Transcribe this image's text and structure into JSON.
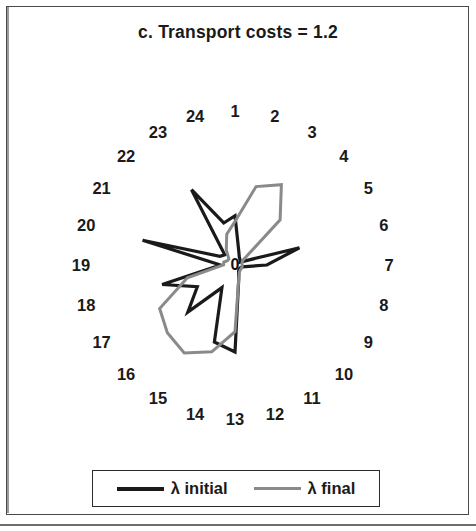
{
  "figure": {
    "title": "c. Transport costs = 1.2",
    "center_label": "0"
  },
  "legend": {
    "entries": [
      {
        "label": "λ initial",
        "color": "#1a1a1a",
        "swatch": "initial"
      },
      {
        "label": "λ final",
        "color": "#8a8a8a",
        "swatch": "final"
      }
    ]
  },
  "chart_data": {
    "type": "line",
    "subtype": "radar",
    "title": "c. Transport costs = 1.2",
    "xlabel": "",
    "ylabel": "",
    "grid": false,
    "legend_position": "bottom",
    "center_label": "0",
    "categories": [
      "1",
      "2",
      "3",
      "4",
      "5",
      "6",
      "7",
      "8",
      "9",
      "10",
      "11",
      "12",
      "13",
      "14",
      "15",
      "16",
      "17",
      "18",
      "19",
      "20",
      "21",
      "22",
      "23",
      "24"
    ],
    "angle_start_deg": 90,
    "angle_direction": "clockwise",
    "rmax": 1.0,
    "rlim": [
      0,
      1.0
    ],
    "series": [
      {
        "name": "λ initial",
        "color": "#1a1a1a",
        "values": [
          0.34,
          0.1,
          0.06,
          0.05,
          0.04,
          0.46,
          0.22,
          0.05,
          0.04,
          0.04,
          0.05,
          0.1,
          0.6,
          0.55,
          0.18,
          0.46,
          0.3,
          0.52,
          0.1,
          0.66,
          0.12,
          0.1,
          0.6,
          0.3
        ]
      },
      {
        "name": "λ final",
        "color": "#8a8a8a",
        "values": [
          0.3,
          0.56,
          0.64,
          0.44,
          0.06,
          0.05,
          0.05,
          0.05,
          0.05,
          0.05,
          0.06,
          0.1,
          0.46,
          0.62,
          0.7,
          0.66,
          0.6,
          0.34,
          0.08,
          0.08,
          0.06,
          0.06,
          0.12,
          0.22
        ]
      }
    ]
  },
  "spoke_label_radius": 154
}
